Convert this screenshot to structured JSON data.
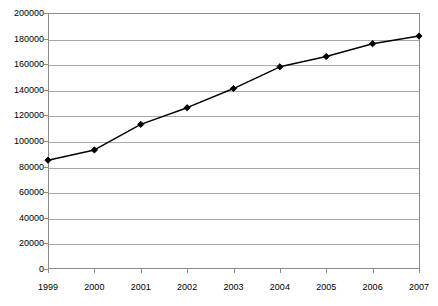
{
  "chart_data": {
    "type": "line",
    "title": "",
    "subtitle": "",
    "xlabel": "",
    "ylabel": "",
    "categories": [
      "1999",
      "2000",
      "2001",
      "2002",
      "2003",
      "2004",
      "2005",
      "2006",
      "2007"
    ],
    "x": [
      1999,
      2000,
      2001,
      2002,
      2003,
      2004,
      2005,
      2006,
      2007
    ],
    "values": [
      85000,
      93000,
      113000,
      126000,
      141000,
      158000,
      166000,
      176000,
      182000
    ],
    "series": [
      {
        "name": "",
        "values": [
          85000,
          93000,
          113000,
          126000,
          141000,
          158000,
          166000,
          176000,
          182000
        ]
      }
    ],
    "ylim": [
      0,
      200000
    ],
    "ytick_labels": [
      "0",
      "20000",
      "40000",
      "60000",
      "80000",
      "100000",
      "120000",
      "140000",
      "160000",
      "180000",
      "200000"
    ],
    "yticks": [
      0,
      20000,
      40000,
      60000,
      80000,
      100000,
      120000,
      140000,
      160000,
      180000,
      200000
    ],
    "grid": "horizontal",
    "legend": "none",
    "marker": "filled-diamond",
    "line_color": "#000000",
    "marker_color": "#000000",
    "grid_color": "#a9a9a9",
    "frame_color": "#8b8b8b",
    "background_color": "#ffffff",
    "annotations": []
  }
}
